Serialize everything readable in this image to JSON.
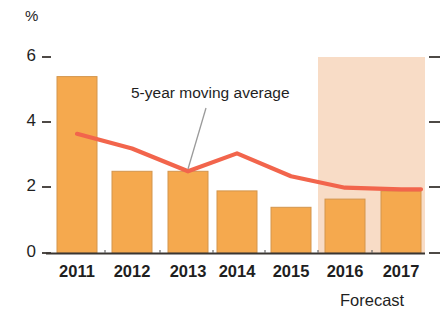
{
  "chart_data": {
    "type": "bar",
    "title": "",
    "subtitle": "",
    "xlabel": "",
    "ylabel": "%",
    "ylim": [
      0,
      6
    ],
    "yticks": [
      0,
      2,
      4,
      6
    ],
    "ytick_labels": [
      "0",
      "2",
      "4",
      "6"
    ],
    "grid": false,
    "legend_position": "inline-annotation",
    "categories": [
      "2011",
      "2012",
      "2013",
      "2014",
      "2015",
      "2016",
      "2017"
    ],
    "series": [
      {
        "name": "Annual rate",
        "type": "bar",
        "color": "#F5A94E",
        "values": [
          5.4,
          2.5,
          2.5,
          1.9,
          1.4,
          1.65,
          1.9
        ]
      },
      {
        "name": "5-year moving average",
        "type": "line",
        "color": "#F2654C",
        "values": [
          3.65,
          3.2,
          2.5,
          3.05,
          2.35,
          2.0,
          1.95
        ]
      }
    ],
    "annotations": [
      {
        "text": "5-year moving average",
        "target_category": "2013",
        "target_series": "5-year moving average"
      },
      {
        "text": "Forecast",
        "span_categories": [
          "2016",
          "2017"
        ],
        "band_color": "#F8DCC6"
      }
    ]
  },
  "axes": {
    "unit_label": "%",
    "y_ticks": [
      {
        "label": "6",
        "value": 6
      },
      {
        "label": "4",
        "value": 4
      },
      {
        "label": "2",
        "value": 2
      },
      {
        "label": "0",
        "value": 0
      }
    ],
    "x_ticks": [
      {
        "label": "2011"
      },
      {
        "label": "2012"
      },
      {
        "label": "2013"
      },
      {
        "label": "2014"
      },
      {
        "label": "2015"
      },
      {
        "label": "2016"
      },
      {
        "label": "2017"
      }
    ]
  },
  "labels": {
    "moving_average": "5-year moving average",
    "forecast": "Forecast"
  },
  "colors": {
    "bar_fill": "#F5A94E",
    "bar_stroke": "#D99A52",
    "line": "#F2654C",
    "forecast_band": "#F8DCC6",
    "axis": "#3A3632",
    "text": "#1f1f1f",
    "leader_line": "#8d8d8d"
  }
}
